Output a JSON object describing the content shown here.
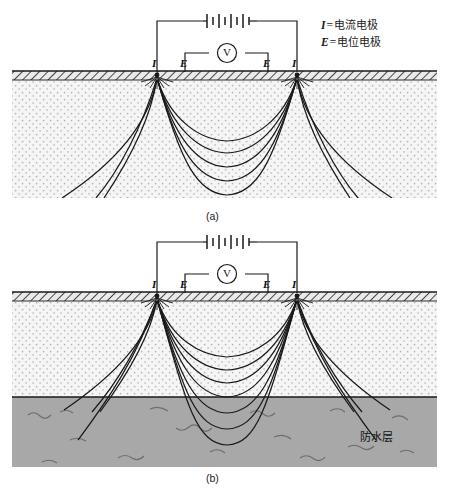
{
  "figure": {
    "legend": [
      {
        "symbol": "I",
        "equals": "=",
        "text": "电流电极"
      },
      {
        "symbol": "E",
        "equals": "=",
        "text": "电位电极"
      }
    ],
    "captions": {
      "a": "(a)",
      "b": "(b)"
    },
    "annotations": {
      "waterproof_layer": "防水层"
    },
    "voltmeter_label": "V",
    "electrode_labels": {
      "outer_left": "I",
      "inner_left": "E",
      "inner_right": "E",
      "outer_right": "I"
    },
    "colors": {
      "line": "#1a1a1a",
      "soil_fill": "#f4f4f4",
      "soil_dot": "#b9b9b9",
      "surface_band": "#e8e8e8",
      "clay_fill": "#a8a8a8",
      "clay_squiggle": "#6d6d6d",
      "background": "#ffffff"
    }
  }
}
